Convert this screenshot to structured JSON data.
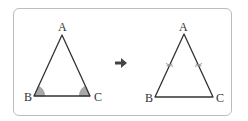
{
  "diagram": {
    "left_triangle": {
      "vertices": {
        "A": "A",
        "B": "B",
        "C": "C"
      },
      "marks": "equal base angles at B and C (shaded)"
    },
    "arrow": {
      "icon": "right-arrow-icon",
      "meaning": "implies"
    },
    "right_triangle": {
      "vertices": {
        "A": "A",
        "B": "B",
        "C": "C"
      },
      "marks": "equal sides AB and AC (tick marks)"
    },
    "colors": {
      "line": "#333333",
      "angle_fill": "#a9a9a9",
      "frame_border": "#bcbcbc",
      "arrow": "#444444",
      "tick": "#9a9a9a"
    }
  }
}
